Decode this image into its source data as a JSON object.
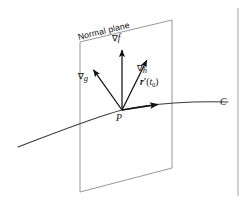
{
  "figure": {
    "domain": "Diagram",
    "background_color": "#ffffff",
    "ink_color": "#111111",
    "plane_edge_color": "#8d8d8d",
    "curve_color": "#3a3a3a",
    "width": 247,
    "height": 203
  },
  "labels": {
    "plane": "Normal plane",
    "grad_f": {
      "operator": "∇",
      "function": "f"
    },
    "grad_g": {
      "operator": "∇",
      "function": "g"
    },
    "grad_h": {
      "operator": "∇",
      "function": "h"
    },
    "tangent": {
      "vector": "r",
      "prime": "′",
      "open": "(",
      "param": "t",
      "subscript": "0",
      "close": ")"
    },
    "point": "P",
    "curve": "C"
  },
  "icons": {
    "arrowhead": "arrowhead-icon",
    "page_rule": "page-margin-rule-icon"
  },
  "geometry": {
    "plane_polygon": [
      [
        80,
        42
      ],
      [
        172,
        20
      ],
      [
        172,
        168
      ],
      [
        80,
        192
      ]
    ],
    "origin_point": [
      122,
      110
    ],
    "vectors": [
      {
        "name": "grad_f",
        "from": [
          122,
          110
        ],
        "to": [
          122,
          48
        ]
      },
      {
        "name": "grad_g",
        "from": [
          122,
          110
        ],
        "to": [
          92,
          68
        ]
      },
      {
        "name": "grad_h",
        "from": [
          122,
          110
        ],
        "to": [
          148,
          58
        ]
      },
      {
        "name": "tangent",
        "from": [
          122,
          110
        ],
        "to": [
          161,
          104
        ]
      }
    ],
    "curve_path": "M 18 147 C 55 133, 92 118, 122 110 C 152 103, 196 101, 228 102",
    "page_rule_x": 238
  },
  "label_positions": {
    "plane": {
      "x": 78,
      "y": 37,
      "rotate_deg": -13.5
    },
    "grad_f": {
      "x": 112,
      "y": 38
    },
    "grad_g": {
      "x": 79,
      "y": 76
    },
    "grad_h": {
      "x": 138,
      "y": 68
    },
    "tangent": {
      "x": 140,
      "y": 83
    },
    "point": {
      "x": 116,
      "y": 115
    },
    "curve": {
      "x": 220,
      "y": 101
    }
  }
}
